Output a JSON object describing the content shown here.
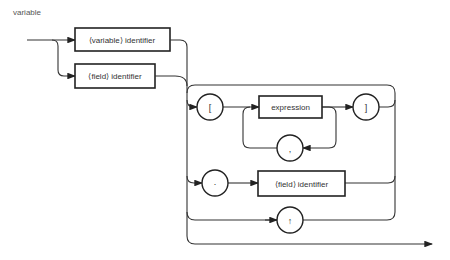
{
  "diagram": {
    "title": "variable",
    "type": "syntax-diagram",
    "nodes": {
      "variable_identifier": "⟨variable⟩ identifier",
      "field_identifier_entry": "⟨field⟩ identifier",
      "open_bracket": "[",
      "expression": "expression",
      "comma": ",",
      "close_bracket": "]",
      "dot": "·",
      "field_identifier_select": "⟨field⟩ identifier",
      "up_arrow": "↑"
    }
  }
}
